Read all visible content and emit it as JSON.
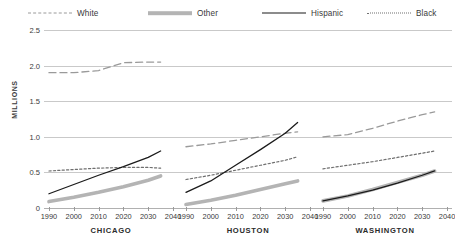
{
  "axis": {
    "y_label": "MILLIONS",
    "y_ticks": [
      "2.5",
      "2.0",
      "1.5",
      "1.0",
      "0.5",
      "0"
    ],
    "x_ticks": [
      "1990",
      "2000",
      "2010",
      "2020",
      "2030",
      "2040"
    ]
  },
  "legend": {
    "items": [
      {
        "label": "White",
        "style": "dashed",
        "color": "#9a9a9a"
      },
      {
        "label": "Other",
        "style": "thick-gray",
        "color": "#b4b4b4"
      },
      {
        "label": "Hispanic",
        "style": "solid",
        "color": "#1b1b1b"
      },
      {
        "label": "Black",
        "style": "dotted",
        "color": "#707070"
      }
    ]
  },
  "panels": [
    {
      "title": "CHICAGO"
    },
    {
      "title": "HOUSTON"
    },
    {
      "title": "WASHINGTON"
    }
  ],
  "chart_data": {
    "type": "line",
    "title": "",
    "xlabel": "",
    "ylabel": "MILLIONS",
    "ylim": [
      0,
      2.5
    ],
    "xlim": [
      1988,
      2042
    ],
    "grid": true,
    "legend_position": "top",
    "y_ticks": [
      0,
      0.5,
      1.0,
      1.5,
      2.0,
      2.5
    ],
    "x": [
      1990,
      2000,
      2010,
      2020,
      2030,
      2035
    ],
    "panels": [
      {
        "name": "CHICAGO",
        "series": [
          {
            "name": "White",
            "values": [
              1.9,
              1.9,
              1.93,
              2.04,
              2.05,
              2.05
            ]
          },
          {
            "name": "Black",
            "values": [
              0.52,
              0.54,
              0.56,
              0.57,
              0.57,
              0.56
            ]
          },
          {
            "name": "Hispanic",
            "values": [
              0.2,
              0.33,
              0.46,
              0.58,
              0.71,
              0.8
            ]
          },
          {
            "name": "Other",
            "values": [
              0.09,
              0.15,
              0.22,
              0.3,
              0.39,
              0.45
            ]
          }
        ]
      },
      {
        "name": "HOUSTON",
        "series": [
          {
            "name": "White",
            "values": [
              0.86,
              0.9,
              0.95,
              1.0,
              1.05,
              1.07
            ]
          },
          {
            "name": "Black",
            "values": [
              0.4,
              0.46,
              0.53,
              0.6,
              0.67,
              0.72
            ]
          },
          {
            "name": "Hispanic",
            "values": [
              0.22,
              0.38,
              0.6,
              0.82,
              1.05,
              1.2
            ]
          },
          {
            "name": "Other",
            "values": [
              0.05,
              0.11,
              0.18,
              0.26,
              0.34,
              0.38
            ]
          }
        ]
      },
      {
        "name": "WASHINGTON",
        "series": [
          {
            "name": "White",
            "values": [
              1.0,
              1.03,
              1.12,
              1.22,
              1.31,
              1.35
            ]
          },
          {
            "name": "Black",
            "values": [
              0.55,
              0.6,
              0.65,
              0.71,
              0.77,
              0.8
            ]
          },
          {
            "name": "Hispanic",
            "values": [
              0.1,
              0.17,
              0.25,
              0.35,
              0.46,
              0.52
            ]
          },
          {
            "name": "Other",
            "values": [
              0.1,
              0.17,
              0.26,
              0.36,
              0.46,
              0.52
            ]
          }
        ]
      }
    ]
  }
}
